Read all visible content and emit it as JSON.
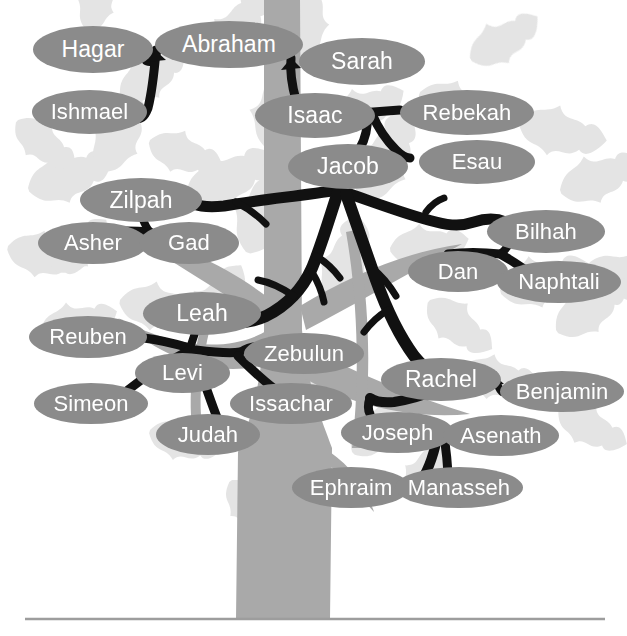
{
  "diagram": {
    "node_fill": "#8b8b8b",
    "node_text_color": "#ffffff",
    "branch_color": "#111111",
    "trunk_color": "#a9a9a9",
    "background_leaf_color": "#e2e2e2",
    "ground_line_color": "#9d9d9d",
    "background_color": "#ffffff"
  },
  "nodes": [
    {
      "id": "hagar",
      "label": "Hagar",
      "x": 33,
      "y": 26,
      "w": 120,
      "h": 47,
      "font": 23
    },
    {
      "id": "abraham",
      "label": "Abraham",
      "x": 155,
      "y": 21,
      "w": 148,
      "h": 47,
      "font": 23
    },
    {
      "id": "sarah",
      "label": "Sarah",
      "x": 299,
      "y": 38,
      "w": 126,
      "h": 47,
      "font": 23
    },
    {
      "id": "ishmael",
      "label": "Ishmael",
      "x": 32,
      "y": 90,
      "w": 115,
      "h": 44,
      "font": 22
    },
    {
      "id": "isaac",
      "label": "Isaac",
      "x": 255,
      "y": 93,
      "w": 120,
      "h": 45,
      "font": 23
    },
    {
      "id": "rebekah",
      "label": "Rebekah",
      "x": 400,
      "y": 90,
      "w": 134,
      "h": 45,
      "font": 22
    },
    {
      "id": "jacob",
      "label": "Jacob",
      "x": 288,
      "y": 144,
      "w": 120,
      "h": 45,
      "font": 23
    },
    {
      "id": "esau",
      "label": "Esau",
      "x": 419,
      "y": 140,
      "w": 116,
      "h": 44,
      "font": 22
    },
    {
      "id": "zilpah",
      "label": "Zilpah",
      "x": 80,
      "y": 178,
      "w": 122,
      "h": 44,
      "font": 23
    },
    {
      "id": "asher",
      "label": "Asher",
      "x": 38,
      "y": 222,
      "w": 110,
      "h": 42,
      "font": 22
    },
    {
      "id": "gad",
      "label": "Gad",
      "x": 139,
      "y": 222,
      "w": 100,
      "h": 42,
      "font": 22
    },
    {
      "id": "bilhah",
      "label": "Bilhah",
      "x": 487,
      "y": 210,
      "w": 118,
      "h": 43,
      "font": 22
    },
    {
      "id": "dan",
      "label": "Dan",
      "x": 408,
      "y": 251,
      "w": 100,
      "h": 41,
      "font": 22
    },
    {
      "id": "naphtali",
      "label": "Naphtali",
      "x": 497,
      "y": 261,
      "w": 124,
      "h": 42,
      "font": 22
    },
    {
      "id": "leah",
      "label": "Leah",
      "x": 143,
      "y": 292,
      "w": 118,
      "h": 43,
      "font": 23
    },
    {
      "id": "reuben",
      "label": "Reuben",
      "x": 29,
      "y": 316,
      "w": 118,
      "h": 42,
      "font": 22
    },
    {
      "id": "zebulun",
      "label": "Zebulun",
      "x": 244,
      "y": 333,
      "w": 120,
      "h": 41,
      "font": 22
    },
    {
      "id": "levi",
      "label": "Levi",
      "x": 135,
      "y": 353,
      "w": 95,
      "h": 40,
      "font": 22
    },
    {
      "id": "rachel",
      "label": "Rachel",
      "x": 381,
      "y": 358,
      "w": 120,
      "h": 43,
      "font": 23
    },
    {
      "id": "benjamin",
      "label": "Benjamin",
      "x": 500,
      "y": 371,
      "w": 124,
      "h": 41,
      "font": 22
    },
    {
      "id": "simeon",
      "label": "Simeon",
      "x": 34,
      "y": 383,
      "w": 114,
      "h": 41,
      "font": 22
    },
    {
      "id": "issachar",
      "label": "Issachar",
      "x": 230,
      "y": 383,
      "w": 122,
      "h": 41,
      "font": 22
    },
    {
      "id": "joseph",
      "label": "Joseph",
      "x": 341,
      "y": 412,
      "w": 113,
      "h": 41,
      "font": 22
    },
    {
      "id": "asenath",
      "label": "Asenath",
      "x": 443,
      "y": 415,
      "w": 116,
      "h": 41,
      "font": 22
    },
    {
      "id": "judah",
      "label": "Judah",
      "x": 156,
      "y": 414,
      "w": 104,
      "h": 41,
      "font": 22
    },
    {
      "id": "ephraim",
      "label": "Ephraim",
      "x": 292,
      "y": 467,
      "w": 118,
      "h": 41,
      "font": 22
    },
    {
      "id": "manasseh",
      "label": "Manasseh",
      "x": 395,
      "y": 467,
      "w": 128,
      "h": 41,
      "font": 22
    }
  ],
  "relationships": [
    {
      "parent": "abraham",
      "partner": "hagar",
      "child": "ishmael"
    },
    {
      "parent": "abraham",
      "partner": "sarah",
      "child": "isaac"
    },
    {
      "parent": "isaac",
      "partner": "rebekah",
      "children": [
        "jacob",
        "esau"
      ]
    },
    {
      "parent": "jacob",
      "partner": "zilpah",
      "children": [
        "asher",
        "gad"
      ]
    },
    {
      "parent": "jacob",
      "partner": "bilhah",
      "children": [
        "dan",
        "naphtali"
      ]
    },
    {
      "parent": "jacob",
      "partner": "leah",
      "children": [
        "reuben",
        "simeon",
        "levi",
        "judah",
        "issachar",
        "zebulun"
      ]
    },
    {
      "parent": "jacob",
      "partner": "rachel",
      "children": [
        "joseph",
        "benjamin"
      ]
    },
    {
      "parent": "joseph",
      "partner": "asenath",
      "children": [
        "ephraim",
        "manasseh"
      ]
    }
  ]
}
